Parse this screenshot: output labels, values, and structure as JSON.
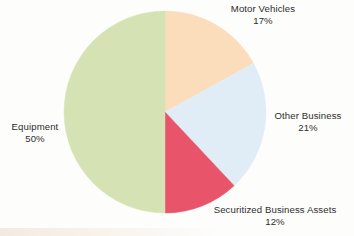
{
  "canvas": {
    "width": 354,
    "height": 236,
    "background": "#fdfdfb"
  },
  "chart_data": {
    "type": "pie",
    "title": "",
    "labels": [
      "Motor Vehicles",
      "Other Business",
      "Securitized Business Assets",
      "Equipment"
    ],
    "values": [
      17,
      21,
      12,
      50
    ],
    "value_labels": [
      "17%",
      "21%",
      "12%",
      "50%"
    ],
    "colors": [
      "#fbddbc",
      "#e0edf7",
      "#e8546a",
      "#d5e3b4"
    ],
    "units": "percent",
    "total": 100,
    "start_angle_deg": 0,
    "direction": "clockwise",
    "legend": "none",
    "labels_position": "outside",
    "geometry": {
      "center_x": 165,
      "center_y": 112,
      "radius": 101
    },
    "slices": [
      {
        "name": "Motor Vehicles",
        "value": 17,
        "value_label": "17%",
        "color": "#fbddbc",
        "start_deg": 0,
        "end_deg": 61.2
      },
      {
        "name": "Other Business",
        "value": 21,
        "value_label": "21%",
        "color": "#e0edf7",
        "start_deg": 61.2,
        "end_deg": 136.8
      },
      {
        "name": "Securitized Business Assets",
        "value": 12,
        "value_label": "12%",
        "color": "#e8546a",
        "start_deg": 136.8,
        "end_deg": 180
      },
      {
        "name": "Equipment",
        "value": 50,
        "value_label": "50%",
        "color": "#d5e3b4",
        "start_deg": 180,
        "end_deg": 360
      }
    ]
  },
  "labels": {
    "motor_vehicles": {
      "name": "Motor Vehicles",
      "pct": "17%"
    },
    "other_business": {
      "name": "Other Business",
      "pct": "21%"
    },
    "securitized": {
      "name": "Securitized Business Assets",
      "pct": "12%"
    },
    "equipment": {
      "name": "Equipment",
      "pct": "50%"
    }
  }
}
